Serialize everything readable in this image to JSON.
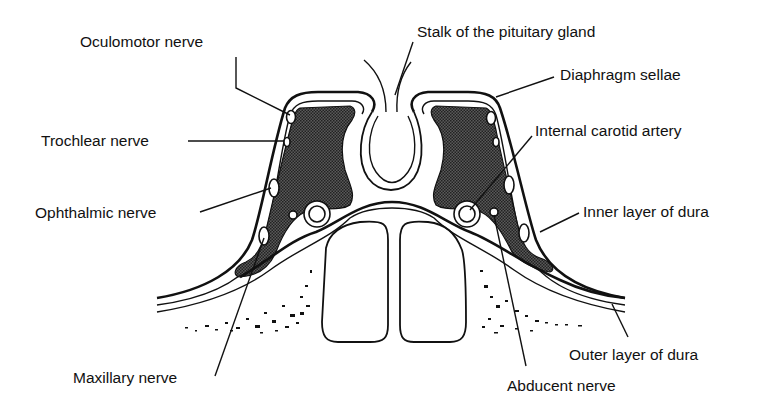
{
  "diagram": {
    "colors": {
      "ink": "#111111",
      "background": "#ffffff",
      "shading": "#3a3a3a"
    },
    "labels": {
      "oculomotor": "Oculomotor nerve",
      "trochlear": "Trochlear nerve",
      "ophthalmic": "Ophthalmic nerve",
      "maxillary": "Maxillary nerve",
      "stalk": "Stalk of the pituitary gland",
      "diaphragm": "Diaphragm sellae",
      "carotid": "Internal carotid artery",
      "inner_dura": "Inner layer of dura",
      "outer_dura": "Outer layer of dura",
      "abducent": "Abducent nerve"
    }
  }
}
